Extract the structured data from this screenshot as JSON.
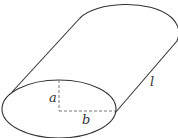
{
  "diagram": {
    "type": "elliptic-cylinder",
    "labels": {
      "semi_minor": "a",
      "semi_major": "b",
      "length": "l"
    },
    "stroke_color": "#333333",
    "dash_color": "#777777",
    "top_text_fragment": ""
  }
}
